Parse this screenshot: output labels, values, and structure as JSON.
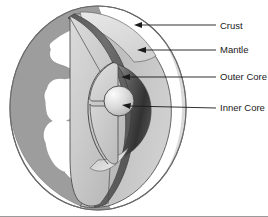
{
  "figure": {
    "background_color": "#ffffff",
    "border_color": "#9a9a9a"
  },
  "labels": [
    {
      "id": "crust",
      "text": "Crust",
      "x": 220,
      "y": 26,
      "leader_from_x": 216,
      "leader_to_x": 136,
      "leader_to_y": 25,
      "arrow": true
    },
    {
      "id": "mantle",
      "text": "Mantle",
      "x": 220,
      "y": 50,
      "leader_from_x": 216,
      "leader_to_x": 138,
      "leader_to_y": 50,
      "arrow": true
    },
    {
      "id": "outer_core",
      "text": "Outer Core",
      "x": 220,
      "y": 77,
      "leader_from_x": 216,
      "leader_to_x": 122,
      "leader_to_y": 77,
      "arrow": true
    },
    {
      "id": "inner_core",
      "text": "Inner Core",
      "x": 220,
      "y": 108,
      "leader_from_x": 216,
      "leader_to_x": 123,
      "leader_to_y": 108,
      "arrow": true
    }
  ],
  "layers": {
    "globe_fill": "#ffffff",
    "globe_outline": "#555555",
    "landmass_fill": "#9d9d9d",
    "crust_fill": "#6e6e6e",
    "mantle_light": "#d3d3d3",
    "mantle_mid": "#c2c2c2",
    "mantle_dark": "#b0b0b0",
    "outer_core_light": "#dcdcdc",
    "outer_core_shadow": "#3a3a3a",
    "inner_core_light": "#f2f2f2",
    "inner_core_mid": "#b8b8b8",
    "line_color": "#333333"
  },
  "geometry": {
    "globe_center_x": 98,
    "globe_center_y": 108,
    "globe_radius_x": 88,
    "globe_radius_y": 102,
    "inner_core_cx": 119,
    "inner_core_cy": 101,
    "inner_core_r": 15
  }
}
